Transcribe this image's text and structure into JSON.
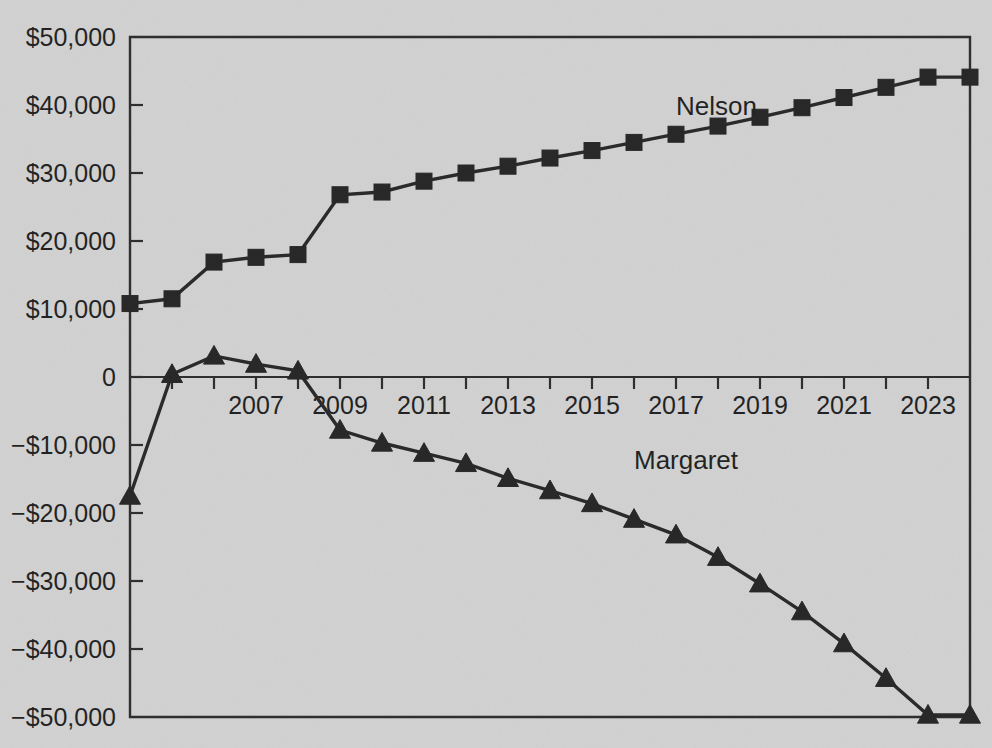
{
  "chart_data": {
    "type": "line",
    "title": "",
    "xlabel": "",
    "ylabel": "",
    "grid": false,
    "legend_position": "inline-annotation",
    "x": [
      2004,
      2005,
      2006,
      2007,
      2008,
      2009,
      2010,
      2011,
      2012,
      2013,
      2014,
      2015,
      2016,
      2017,
      2018,
      2019,
      2020,
      2021,
      2022,
      2023,
      2024
    ],
    "xlim": [
      2004,
      2024
    ],
    "ylim": [
      -50000,
      50000
    ],
    "ytick_values": [
      50000,
      40000,
      30000,
      20000,
      10000,
      0,
      -10000,
      -20000,
      -30000,
      -40000,
      -50000
    ],
    "ytick_labels": [
      "$50,000",
      "$40,000",
      "$30,000",
      "$20,000",
      "$10,000",
      "0",
      "−$10,000",
      "−$20,000",
      "−$30,000",
      "−$40,000",
      "−$50,000"
    ],
    "xtick_values": [
      2004,
      2005,
      2006,
      2007,
      2008,
      2009,
      2010,
      2011,
      2012,
      2013,
      2014,
      2015,
      2016,
      2017,
      2018,
      2019,
      2020,
      2021,
      2022,
      2023,
      2024
    ],
    "xtick_labels_shown": [
      "2007",
      "2009",
      "2011",
      "2013",
      "2015",
      "2017",
      "2019",
      "2021",
      "2023"
    ],
    "xtick_labels_shown_values": [
      2007,
      2009,
      2011,
      2013,
      2015,
      2017,
      2019,
      2021,
      2023
    ],
    "series": [
      {
        "name": "Nelson",
        "marker": "square",
        "color": "#242424",
        "label_x": 2017,
        "label_y": 38500,
        "values": [
          10800,
          11500,
          16900,
          17600,
          18000,
          26800,
          27200,
          28800,
          30000,
          31000,
          32200,
          33300,
          34500,
          35700,
          36900,
          38200,
          39600,
          41100,
          42600,
          44100,
          44100
        ]
      },
      {
        "name": "Margaret",
        "marker": "triangle",
        "color": "#242424",
        "label_x": 2016,
        "label_y": -13500,
        "values": [
          -17500,
          400,
          3100,
          1900,
          900,
          -7800,
          -9700,
          -11200,
          -12700,
          -14900,
          -16700,
          -18600,
          -20900,
          -23200,
          -26500,
          -30400,
          -34500,
          -39200,
          -44300,
          -49700,
          -49700
        ]
      }
    ]
  },
  "annotations": {
    "nelson_label": "Nelson",
    "margaret_label": "Margaret"
  },
  "colors": {
    "background": "#d5d5d5",
    "ink": "#242424",
    "axis": "#2b2b2b"
  }
}
